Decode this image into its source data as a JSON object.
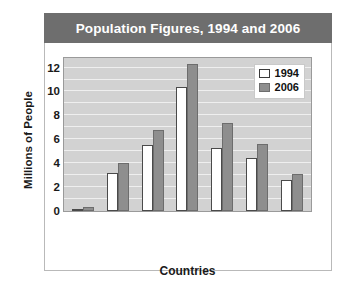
{
  "figure": {
    "title": "Population Figures, 1994 and 2006"
  },
  "chart_data": {
    "type": "bar",
    "title": "Population Figures, 1994 and 2006",
    "xlabel": "Countries",
    "ylabel": "Millions of People",
    "ylim": [
      0,
      12.8
    ],
    "yticks": [
      0,
      2,
      4,
      6,
      8,
      10,
      12
    ],
    "gridline_interval": 1,
    "grid": true,
    "legend_position": "top-right",
    "categories": [
      "Belize",
      "Costa Rica",
      "El Salvador",
      "Guatemala",
      "Honduras",
      "Nicaragua",
      "Panama"
    ],
    "series": [
      {
        "name": "1994",
        "color": "#ffffff",
        "values": [
          0.2,
          3.2,
          5.5,
          10.4,
          5.3,
          4.4,
          2.6
        ]
      },
      {
        "name": "2006",
        "color": "#8e8e8e",
        "values": [
          0.3,
          4.0,
          6.8,
          12.3,
          7.4,
          5.6,
          3.1
        ]
      }
    ]
  },
  "legend": [
    {
      "label": "1994"
    },
    {
      "label": "2006"
    }
  ]
}
